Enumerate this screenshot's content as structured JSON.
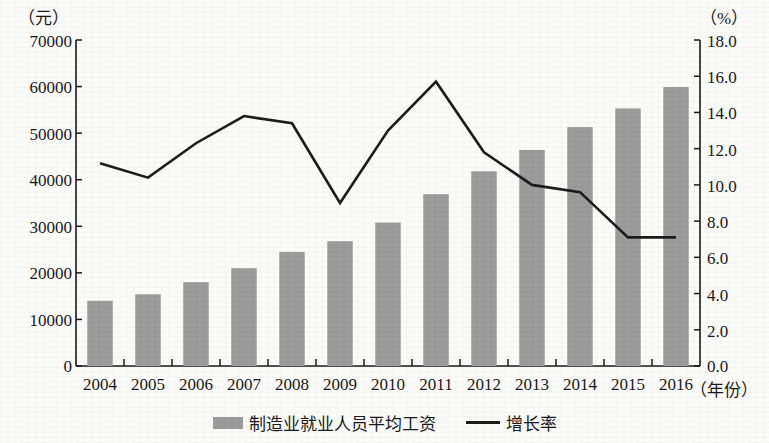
{
  "axes": {
    "left_unit": "（元）",
    "right_unit": "（%）",
    "x_unit": "（年份）",
    "left_ticks": [
      "70000",
      "60000",
      "50000",
      "40000",
      "30000",
      "20000",
      "10000",
      "0"
    ],
    "right_ticks": [
      "18.0",
      "16.0",
      "14.0",
      "12.0",
      "10.0",
      "8.0",
      "6.0",
      "4.0",
      "2.0",
      "0.0"
    ]
  },
  "legend": {
    "bar_label": "制造业就业人员平均工资",
    "line_label": "增长率"
  },
  "colors": {
    "bar": "#9c9c9c",
    "line": "#1d1d1d",
    "axis": "#1a1a1a",
    "background": "#fbfbfa"
  },
  "chart_data": {
    "type": "bar",
    "title": "",
    "subtitle": "",
    "xlabel": "（年份）",
    "ylabel": "（元）",
    "y2label": "（%）",
    "ylim": [
      0,
      70000
    ],
    "y2lim": [
      0.0,
      18.0
    ],
    "ytick_step": 10000,
    "y2tick_step": 2.0,
    "grid": false,
    "legend_position": "bottom-center",
    "categories": [
      "2004",
      "2005",
      "2006",
      "2007",
      "2008",
      "2009",
      "2010",
      "2011",
      "2012",
      "2013",
      "2014",
      "2015",
      "2016"
    ],
    "series": [
      {
        "name": "制造业就业人员平均工资",
        "type": "bar",
        "axis": "left",
        "unit": "元",
        "color": "#9c9c9c",
        "values": [
          14000,
          15400,
          18000,
          21000,
          24500,
          26800,
          30800,
          36900,
          41800,
          46400,
          51300,
          55300,
          59900
        ]
      },
      {
        "name": "增长率",
        "type": "line",
        "axis": "right",
        "unit": "%",
        "color": "#1d1d1d",
        "values": [
          11.2,
          10.4,
          12.3,
          13.8,
          13.4,
          9.0,
          13.0,
          15.7,
          11.8,
          10.0,
          9.6,
          7.1,
          7.1
        ]
      }
    ]
  }
}
